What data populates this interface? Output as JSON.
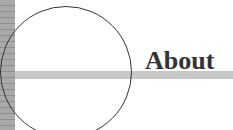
{
  "page": {
    "heading": "About"
  },
  "colors": {
    "stripe_base": "#a9a9a9",
    "stripe_line": "#8f8f8f",
    "rule": "#c8c8c8",
    "ink": "#333333",
    "background": "#ffffff"
  }
}
